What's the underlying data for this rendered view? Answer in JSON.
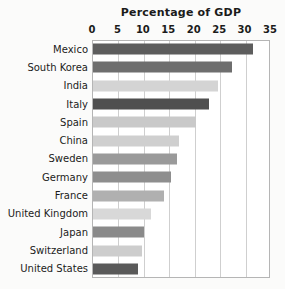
{
  "chart_data": {
    "type": "bar",
    "orientation": "horizontal",
    "title": "Percentage of GDP",
    "xlabel": "",
    "ylabel": "",
    "xlim": [
      0,
      35
    ],
    "xticks": [
      0,
      5,
      10,
      15,
      20,
      25,
      30,
      35
    ],
    "xtick_labels": [
      "0",
      "5",
      "10",
      "15",
      "20",
      "25",
      "30",
      "35"
    ],
    "grid": "vertical",
    "legend": "none",
    "categories": [
      "Mexico",
      "South Korea",
      "India",
      "Italy",
      "Spain",
      "China",
      "Sweden",
      "Germany",
      "France",
      "United Kingdom",
      "Japan",
      "Switzerland",
      "United States"
    ],
    "values": [
      31.5,
      27.3,
      24.5,
      22.8,
      20.2,
      16.9,
      16.5,
      15.3,
      14.0,
      11.4,
      10.0,
      9.6,
      8.8
    ],
    "bar_colors": [
      "#5d5d5d",
      "#6e6e6e",
      "#d4d4d4",
      "#4f4f4f",
      "#c9c9c9",
      "#cfcfcf",
      "#9a9a9a",
      "#8e8e8e",
      "#b0b0b0",
      "#d8d8d8",
      "#8a8a8a",
      "#cdcdcd",
      "#5a5a5a"
    ]
  },
  "colors": {
    "background": "#fbfbfa",
    "plot_background": "#ffffff",
    "gridline": "#cfcfcf",
    "axis_border": "#b5b5b5",
    "text": "#1b1b1b"
  }
}
